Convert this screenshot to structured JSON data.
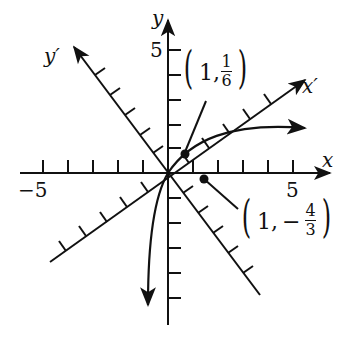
{
  "figure": {
    "axes": {
      "x_label": "x",
      "y_label": "y",
      "x_prime_label": "x′",
      "y_prime_label": "y′",
      "x_tick_min_label": "−5",
      "x_tick_max_label": "5",
      "y_tick_max_label": "5",
      "x_range": [
        -5,
        5
      ],
      "y_range": [
        -5,
        5
      ]
    },
    "points": [
      {
        "label_prefix": "1,",
        "frac_num": "1",
        "frac_den": "6",
        "sign": "",
        "coords": [
          1,
          0.1667
        ]
      },
      {
        "label_prefix": "1,",
        "frac_num": "4",
        "frac_den": "3",
        "sign": "−",
        "coords": [
          1,
          -1.3333
        ]
      }
    ],
    "open_paren": "(",
    "close_paren": ")",
    "colors": {
      "ink": "#111111",
      "background": "#ffffff"
    }
  }
}
